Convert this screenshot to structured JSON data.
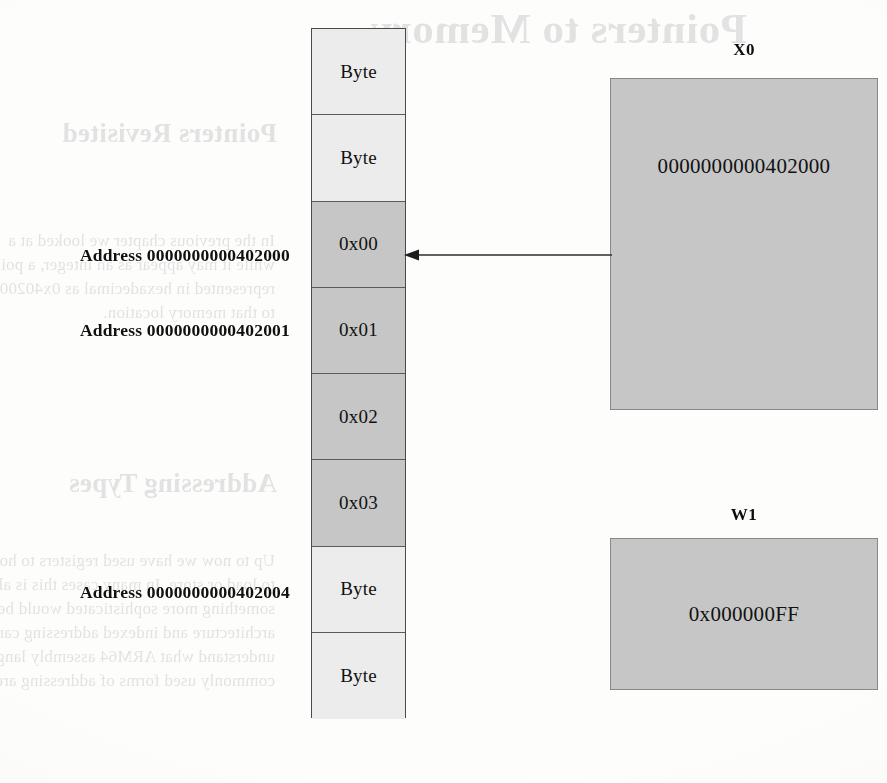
{
  "figure": {
    "kind": "memory-pointer-diagram",
    "colors": {
      "page_background": "#fdfdfc",
      "memory_cell_light": "#ececec",
      "memory_cell_dark": "#c6c6c6",
      "register_fill": "#c6c6c6",
      "cell_border": "#5a5a5a",
      "text": "#111111",
      "ghost_text": "#5b6166"
    }
  },
  "memory": {
    "name": "memory-column",
    "cells": [
      {
        "label": "Byte",
        "shade": "light"
      },
      {
        "label": "Byte",
        "shade": "light"
      },
      {
        "label": "0x00",
        "shade": "dark"
      },
      {
        "label": "0x01",
        "shade": "dark"
      },
      {
        "label": "0x02",
        "shade": "dark"
      },
      {
        "label": "0x03",
        "shade": "dark"
      },
      {
        "label": "Byte",
        "shade": "light"
      },
      {
        "label": "Byte",
        "shade": "light"
      }
    ]
  },
  "address_labels": [
    {
      "text": "Address 0000000000402000",
      "cell_index": 2,
      "top": 245
    },
    {
      "text": "Address 0000000000402001",
      "cell_index": 3,
      "top": 320
    },
    {
      "text": "Address 0000000000402004",
      "cell_index": 6,
      "top": 582
    }
  ],
  "registers": [
    {
      "name": "X0",
      "label": "X0",
      "value": "0000000000402000",
      "points_to": "Address 0000000000402000"
    },
    {
      "name": "W1",
      "label": "W1",
      "value": "0x000000FF"
    }
  ],
  "arrow": {
    "name": "pointer-arrow",
    "from": "X0",
    "to": "0x00",
    "direction": "left"
  },
  "bleed_through": {
    "note": "mirrored show-through text from the reverse side of the scanned page",
    "items": [
      {
        "text": "Pointers to Memory",
        "style": "h1",
        "left": 140,
        "top": 4
      },
      {
        "text": "Pointers Revisited",
        "style": "h2",
        "left": 610,
        "top": 118
      },
      {
        "text": "In the previous chapter we looked at a",
        "style": "body",
        "left": 612,
        "top": 228
      },
      {
        "text": "while it may appear as an integer, a pointer is actually a memory address.",
        "style": "body",
        "left": 612,
        "top": 252
      },
      {
        "text": "represented in hexadecimal as 0x402000, this means a pointer would hold 0x4",
        "style": "body",
        "left": 612,
        "top": 276
      },
      {
        "text": "to that memory location.",
        "style": "body",
        "left": 612,
        "top": 300
      },
      {
        "text": "Addressing Types",
        "style": "h2",
        "left": 610,
        "top": 468
      },
      {
        "text": "Up to now we have used registers to hold the address of the value we wanted",
        "style": "body",
        "left": 612,
        "top": 548
      },
      {
        "text": "to load or store. In many cases this is all you need, but there are times when",
        "style": "body",
        "left": 612,
        "top": 572
      },
      {
        "text": "something more sophisticated would be of use. Load/store",
        "style": "body",
        "left": 612,
        "top": 596
      },
      {
        "text": "architecture and indexed addressing can make your life easier.",
        "style": "body",
        "left": 612,
        "top": 620
      },
      {
        "text": "understand what ARM64 assembly language provides.",
        "style": "body",
        "left": 612,
        "top": 644
      },
      {
        "text": "commonly used forms of addressing are described below.",
        "style": "body",
        "left": 612,
        "top": 668
      }
    ]
  }
}
